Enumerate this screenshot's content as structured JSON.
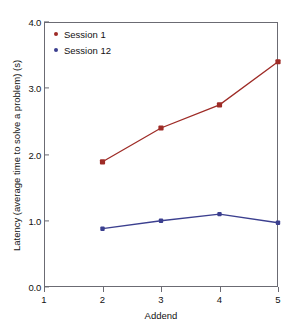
{
  "chart_data": {
    "type": "line",
    "title": "",
    "xlabel": "Addend",
    "ylabel": "Latency (average time to solve a problem) (s)",
    "xlim": [
      1,
      5
    ],
    "ylim": [
      0.0,
      4.0
    ],
    "xticks": [
      "1",
      "2",
      "3",
      "4",
      "5"
    ],
    "xtick_values": [
      1,
      2,
      3,
      4,
      5
    ],
    "yticks": [
      "0.0",
      "1.0",
      "2.0",
      "3.0",
      "4.0"
    ],
    "ytick_values": [
      0.0,
      1.0,
      2.0,
      3.0,
      4.0
    ],
    "grid": false,
    "legend_position": "top-left",
    "x": [
      2,
      3,
      4,
      5
    ],
    "series": [
      {
        "name": "Session 1",
        "color": "#9e2b26",
        "values": [
          1.89,
          2.4,
          2.75,
          3.4
        ]
      },
      {
        "name": "Session 12",
        "color": "#3b3f8f",
        "values": [
          0.88,
          1.0,
          1.1,
          0.97
        ]
      }
    ]
  },
  "legend": {
    "items": [
      {
        "label": "Session 1",
        "color": "#9e2b26"
      },
      {
        "label": "Session 12",
        "color": "#3b3f8f"
      }
    ]
  },
  "axes": {
    "x_title": "Addend",
    "y_title": "Latency (average time to solve a problem) (s)",
    "x_tick_labels": [
      "1",
      "2",
      "3",
      "4",
      "5"
    ],
    "y_tick_labels": [
      "0.0",
      "1.0",
      "2.0",
      "3.0",
      "4.0"
    ],
    "frame_color": "#6b6b73"
  }
}
